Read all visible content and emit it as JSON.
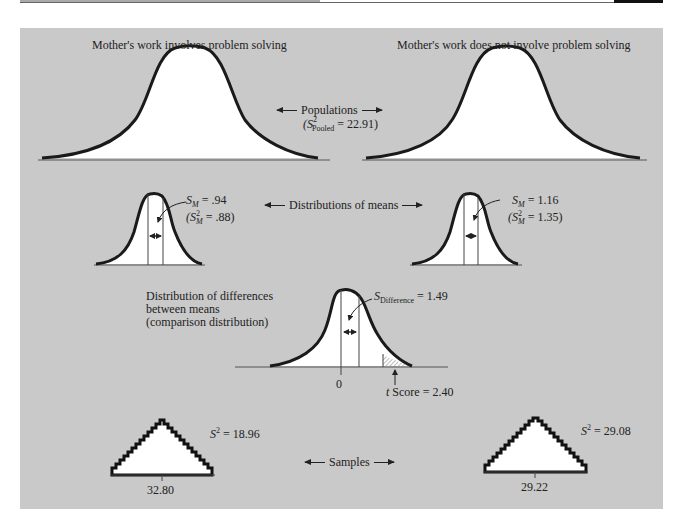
{
  "colors": {
    "panel_bg": "#c9c9c9",
    "curve_fill": "#ffffff",
    "curve_stroke": "#1a1a1a",
    "baseline": "#555555"
  },
  "populations": {
    "left_title": "Mother's work involves problem solving",
    "right_title": "Mother's work does not involve problem solving",
    "label": "Populations",
    "pooled_prefix": "(S",
    "pooled_sup": "2",
    "pooled_sub": "Pooled",
    "pooled_value": " = 22.91)"
  },
  "means": {
    "label": "Distributions of means",
    "left": {
      "sm_sym": "S",
      "sm_sub": "M",
      "sm_value": " = .94",
      "var_prefix": "(S",
      "var_sup": "2",
      "var_sub": "M",
      "var_value": " = .88)"
    },
    "right": {
      "sm_sym": "S",
      "sm_sub": "M",
      "sm_value": " = 1.16",
      "var_prefix": "(S",
      "var_sup": "2",
      "var_sub": "M",
      "var_value": " = 1.35)"
    }
  },
  "differences": {
    "description_line1": "Distribution of differences",
    "description_line2": "between means",
    "description_line3": "(comparison distribution)",
    "sd_sym": "S",
    "sd_sub": "Difference",
    "sd_value": " = 1.49",
    "zero_tick": "0",
    "t_sym": "t",
    "t_label": " Score = 2.40"
  },
  "samples": {
    "label": "Samples",
    "left": {
      "s2_sym": "S",
      "s2_sup": "2",
      "s2_value": " = 18.96",
      "mean": "32.80"
    },
    "right": {
      "s2_sym": "S",
      "s2_sup": "2",
      "s2_value": " = 29.08",
      "mean": "29.22"
    }
  }
}
